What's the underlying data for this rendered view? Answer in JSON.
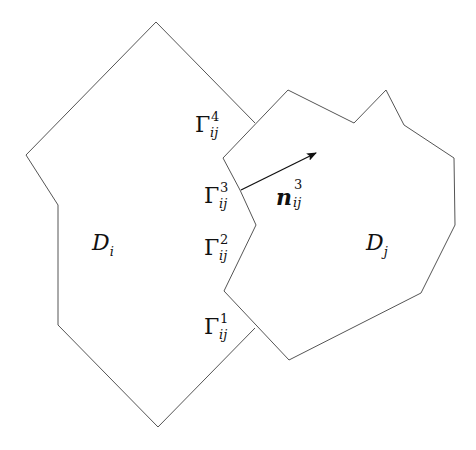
{
  "diagram": {
    "colors": {
      "line": "#555555",
      "arrow": "#111111",
      "background": "#ffffff"
    },
    "domains": [
      {
        "id": "Di",
        "label": "D",
        "subscript": "i",
        "points": "255,123 156,22 26,155 58,205 58,325 158,427 255,328"
      },
      {
        "id": "Dj",
        "label": "D",
        "subscript": "j",
        "points": "223,158 288,90 354,123 386,90 404,125 454,158 455,225 421,293 289,360 224,291 256,225 240,190"
      }
    ],
    "interfaces": [
      {
        "label": "Γ",
        "superscript": "4",
        "subscript": "ij"
      },
      {
        "label": "Γ",
        "superscript": "3",
        "subscript": "ij"
      },
      {
        "label": "Γ",
        "superscript": "2",
        "subscript": "ij"
      },
      {
        "label": "Γ",
        "superscript": "1",
        "subscript": "ij"
      }
    ],
    "normal": {
      "label": "n",
      "superscript": "3",
      "subscript": "ij",
      "from": [
        241,
        190
      ],
      "to": [
        316,
        153
      ]
    }
  }
}
